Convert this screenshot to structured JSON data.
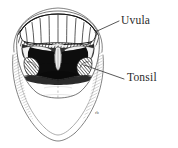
{
  "figure": {
    "style": "black-and-white engraving / line art",
    "background_color": "#ffffff",
    "ink_color": "#1a1a1a",
    "label_color": "#2b2b2b",
    "artist_mark": "rb"
  },
  "labels": [
    {
      "id": "uvula",
      "text": "Uvula",
      "leader_from": [
        95,
        32
      ],
      "leader_to": [
        119,
        21
      ]
    },
    {
      "id": "tonsil",
      "text": "Tonsil",
      "leader_from": [
        84,
        65
      ],
      "leader_to": [
        124,
        79
      ]
    }
  ],
  "parts": {
    "lips_outer": "outer lip and chin contour",
    "upper_teeth": "upper dental arch, incisors and molars",
    "hard_palate": "shaded roof of mouth",
    "throat_cavity": "dark oropharynx opening",
    "uvula": "central pendant tissue at soft palate",
    "tonsils": "palatine tonsils flanking the throat",
    "tongue": "large light tongue filling lower mouth"
  }
}
